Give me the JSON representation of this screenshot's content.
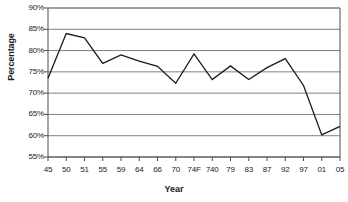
{
  "chart_data": {
    "type": "line",
    "title": "",
    "xlabel": "Year",
    "ylabel": "Percentage",
    "grid": true,
    "legend": "none",
    "ylim": [
      55,
      90
    ],
    "ytick_labels": [
      "90%",
      "85%",
      "80%",
      "75%",
      "70%",
      "65%",
      "60%",
      "55%"
    ],
    "ytick_values": [
      90,
      85,
      80,
      75,
      70,
      65,
      60,
      55
    ],
    "categories": [
      "45",
      "50",
      "51",
      "55",
      "59",
      "64",
      "66",
      "70",
      "74F",
      "740",
      "79",
      "83",
      "87",
      "92",
      "97",
      "01",
      "05"
    ],
    "values": [
      73.5,
      84.0,
      83.0,
      77.0,
      79.0,
      77.5,
      76.3,
      72.3,
      79.2,
      73.2,
      76.4,
      73.2,
      76.0,
      78.1,
      71.8,
      60.2,
      62.2
    ],
    "series": [
      {
        "name": "Percentage",
        "color": "#1a1a1a",
        "values": [
          73.5,
          84.0,
          83.0,
          77.0,
          79.0,
          77.5,
          76.3,
          72.3,
          79.2,
          73.2,
          76.4,
          73.2,
          76.0,
          78.1,
          71.8,
          60.2,
          62.2
        ]
      }
    ]
  },
  "colors": {
    "line": "#1a1a1a",
    "grid": "#808080",
    "axis": "#4d4d4d",
    "background": "#ffffff",
    "text": "#1a1a1a"
  }
}
